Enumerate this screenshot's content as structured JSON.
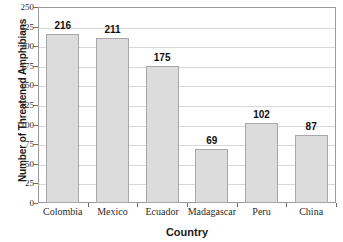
{
  "chart_data": {
    "type": "bar",
    "title": "",
    "xlabel": "Country",
    "ylabel": "Number of Threatened Amphibians",
    "categories": [
      "Colombia",
      "Mexico",
      "Ecuador",
      "Madagascar",
      "Peru",
      "China"
    ],
    "values": [
      216,
      211,
      175,
      69,
      102,
      87
    ],
    "value_labels": [
      "216",
      "211",
      "175",
      "69",
      "102",
      "87"
    ],
    "ylim": [
      0,
      250
    ],
    "ytick_values": [
      0,
      25,
      50,
      75,
      100,
      125,
      150,
      175,
      200,
      225,
      250
    ],
    "ytick_labels": [
      "0",
      "25",
      "50",
      "75",
      "100",
      "125",
      "150",
      "175",
      "200",
      "225",
      "250"
    ],
    "grid": "horizontal",
    "legend": "none",
    "bar_fill_color": "#dcdcdc",
    "bar_border_color": "#a8a8a8",
    "gridline_color": "#d8d8d8",
    "axis_color": "#9a9a9a",
    "text_color": "#1a1a1a"
  }
}
